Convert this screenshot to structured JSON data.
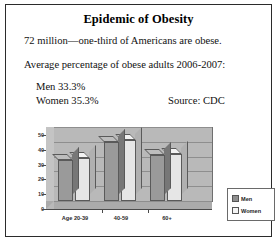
{
  "slide": {
    "title": "Epidemic of Obesity",
    "line1": "72 million—one-third of Americans are obese.",
    "line2": "Average percentage of obese adults 2006-2007:",
    "stat_men": "Men 33.3%",
    "stat_women": "Women 35.3%",
    "source": "Source: CDC",
    "border_color": "#2b2b2b",
    "background": "#ffffff"
  },
  "chart_data": {
    "type": "bar",
    "title": "",
    "xlabel": "",
    "ylabel": "",
    "categories": [
      "Age 20-39",
      "40-59",
      "60+"
    ],
    "series": [
      {
        "name": "Men",
        "values": [
          28,
          40,
          31
        ],
        "color": "#9a9a9a"
      },
      {
        "name": "Women",
        "values": [
          29,
          41,
          32
        ],
        "color": "#e6e6e6"
      }
    ],
    "ylim": [
      0,
      50
    ],
    "yticks": [
      0,
      10,
      20,
      30,
      40,
      50
    ],
    "ytick_labels": [
      "0",
      "10",
      "20",
      "30",
      "40",
      "50"
    ],
    "grid": true,
    "legend_position": "right",
    "legend": [
      "Men",
      "Women"
    ],
    "style": "3d-column"
  }
}
